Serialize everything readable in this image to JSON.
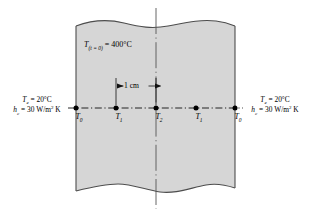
{
  "figure": {
    "name": "transient-conduction-slab-nodal-diagram",
    "colors": {
      "slab_fill": "#d6d6d6",
      "outline": "#4d4d4d",
      "line": "#111111",
      "text": "#000000",
      "background": "#ffffff"
    },
    "geometry": {
      "slab_left_x": 76,
      "slab_right_x": 235,
      "slab_top_y": 22,
      "slab_bottom_y": 192,
      "centerline_x": 156,
      "axis_y": 108,
      "node_xs": [
        76,
        116,
        156,
        196,
        235
      ]
    }
  },
  "labels": {
    "initial_temp": {
      "symbol": "T",
      "subscript": "(t = 0)",
      "equals": " = ",
      "value": "400",
      "unit": "°C",
      "full_text": "T(t = 0) = 400°C"
    },
    "left_env": {
      "temp_symbol": "T",
      "temp_subscript": "e",
      "temp_value": " = 20°C",
      "coef_symbol": "h",
      "coef_subscript": "c",
      "coef_value": " = 30 W/m",
      "coef_exponent": "2",
      "coef_unit": " K",
      "line1": "Te = 20°C",
      "line2": "hc = 30 W/m2 K"
    },
    "right_env": {
      "temp_symbol": "T",
      "temp_subscript": "e",
      "temp_value": " = 20°C",
      "coef_symbol": "h",
      "coef_subscript": "c",
      "coef_value": " = 30 W/m",
      "coef_exponent": "2",
      "coef_unit": " K",
      "line1": "Te = 20°C",
      "line2": "hc = 30 W/m2 K"
    },
    "dimension": {
      "text": "1 cm",
      "from_node": "T1",
      "to_node": "T2"
    },
    "nodes": [
      {
        "symbol": "T",
        "subscript": "0",
        "x": 76
      },
      {
        "symbol": "T",
        "subscript": "1",
        "x": 116
      },
      {
        "symbol": "T",
        "subscript": "2",
        "x": 156
      },
      {
        "symbol": "T",
        "subscript": "1",
        "x": 196
      },
      {
        "symbol": "T",
        "subscript": "0",
        "x": 235
      }
    ]
  }
}
